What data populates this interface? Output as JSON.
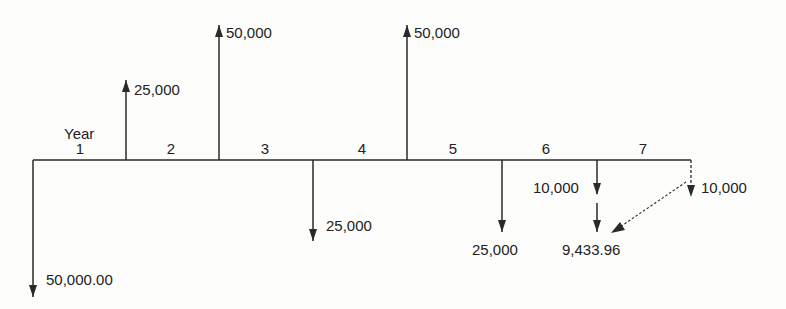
{
  "diagram": {
    "type": "cash-flow-diagram",
    "axis_label": "Year",
    "periods": [
      "1",
      "2",
      "3",
      "4",
      "5",
      "6",
      "7"
    ],
    "cash_flows": [
      {
        "time": 0,
        "direction": "down",
        "label": "50,000.00"
      },
      {
        "time": 1,
        "direction": "up",
        "label": "25,000"
      },
      {
        "time": 2,
        "direction": "up",
        "label": "50,000"
      },
      {
        "time": 3,
        "direction": "down",
        "label": "25,000"
      },
      {
        "time": 4,
        "direction": "up",
        "label": "50,000"
      },
      {
        "time": 5,
        "direction": "down",
        "label": "25,000"
      },
      {
        "time": 6,
        "direction": "down",
        "label": "10,000"
      },
      {
        "time": 6,
        "direction": "down",
        "label": "9,433.96",
        "note": "discounted from year 7"
      },
      {
        "time": 7,
        "direction": "down",
        "label": "10,000",
        "style": "dashed"
      }
    ],
    "colors": {
      "line": "#2a2a2a",
      "background": "#fdfdfc"
    }
  }
}
